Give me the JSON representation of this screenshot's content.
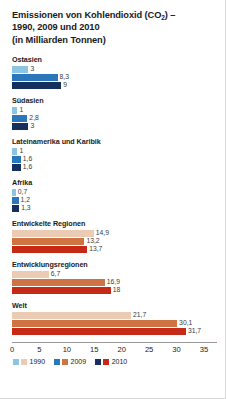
{
  "title": {
    "line1_a": "Emissionen von Kohlendioxid (CO",
    "line1_sub": "2",
    "line1_b": ") –",
    "line2": "1990, 2009 und 2010",
    "line3": "(in Milliarden Tonnen)"
  },
  "axis": {
    "ticks": [
      "0",
      "5",
      "10",
      "15",
      "20",
      "25",
      "30",
      "35"
    ],
    "min": 0,
    "max": 35,
    "step": 5
  },
  "legend": {
    "items": [
      {
        "label": "1990",
        "blue": "#8cc4e4",
        "red": "#eccbb4"
      },
      {
        "label": "2009",
        "blue": "#2a77bb",
        "red": "#cf7244"
      },
      {
        "label": "2010",
        "blue": "#15305f",
        "red": "#c42a16"
      }
    ]
  },
  "colors": {
    "blue_1990": "#8cc4e4",
    "blue_2009": "#2a77bb",
    "blue_2010": "#15305f",
    "red_1990": "#eccbb4",
    "red_2009": "#cf7244",
    "red_2010": "#c42a16"
  },
  "chart_data": {
    "type": "bar",
    "title": "Emissionen von Kohlendioxid (CO2) – 1990, 2009 und 2010 (in Milliarden Tonnen)",
    "xlabel": "",
    "ylabel": "",
    "xlim": [
      0,
      35
    ],
    "grid": false,
    "legend_position": "bottom",
    "orientation": "horizontal",
    "categories": [
      "Ostasien",
      "Südasien",
      "Lateinamerika und Karibik",
      "Afrika",
      "Entwickelte Regionen",
      "Entwicklungsregionen",
      "Welt"
    ],
    "series": [
      {
        "name": "1990",
        "values": [
          3,
          1,
          1,
          0.7,
          14.9,
          6.7,
          21.7
        ]
      },
      {
        "name": "2009",
        "values": [
          8.3,
          2.8,
          1.6,
          1.2,
          13.2,
          16.9,
          30.1
        ]
      },
      {
        "name": "2010",
        "values": [
          9,
          3,
          1.6,
          1.3,
          13.7,
          18,
          31.7
        ]
      }
    ]
  },
  "groups": [
    {
      "label": "Ostasien",
      "palette": "blue",
      "bars": [
        {
          "year": "1990",
          "value": 3,
          "display": "3"
        },
        {
          "year": "2009",
          "value": 8.3,
          "display": "8,3"
        },
        {
          "year": "2010",
          "value": 9,
          "display": "9"
        }
      ]
    },
    {
      "label": "Südasien",
      "palette": "blue",
      "bars": [
        {
          "year": "1990",
          "value": 1,
          "display": "1"
        },
        {
          "year": "2009",
          "value": 2.8,
          "display": "2,8"
        },
        {
          "year": "2010",
          "value": 3,
          "display": "3"
        }
      ]
    },
    {
      "label": "Lateinamerika und Karibik",
      "palette": "blue",
      "bars": [
        {
          "year": "1990",
          "value": 1,
          "display": "1"
        },
        {
          "year": "2009",
          "value": 1.6,
          "display": "1,6"
        },
        {
          "year": "2010",
          "value": 1.6,
          "display": "1,6"
        }
      ]
    },
    {
      "label": "Afrika",
      "palette": "blue",
      "bars": [
        {
          "year": "1990",
          "value": 0.7,
          "display": "0,7"
        },
        {
          "year": "2009",
          "value": 1.2,
          "display": "1,2"
        },
        {
          "year": "2010",
          "value": 1.3,
          "display": "1,3"
        }
      ]
    },
    {
      "label": "Entwickelte Regionen",
      "palette": "red",
      "bars": [
        {
          "year": "1990",
          "value": 14.9,
          "display": "14,9"
        },
        {
          "year": "2009",
          "value": 13.2,
          "display": "13,2"
        },
        {
          "year": "2010",
          "value": 13.7,
          "display": "13,7"
        }
      ]
    },
    {
      "label": "Entwicklungsregionen",
      "palette": "red",
      "bars": [
        {
          "year": "1990",
          "value": 6.7,
          "display": "6,7"
        },
        {
          "year": "2009",
          "value": 16.9,
          "display": "16,9"
        },
        {
          "year": "2010",
          "value": 18,
          "display": "18"
        }
      ]
    },
    {
      "label": "Welt",
      "palette": "red",
      "bars": [
        {
          "year": "1990",
          "value": 21.7,
          "display": "21,7"
        },
        {
          "year": "2009",
          "value": 30.1,
          "display": "30,1"
        },
        {
          "year": "2010",
          "value": 31.7,
          "display": "31,7"
        }
      ]
    }
  ]
}
